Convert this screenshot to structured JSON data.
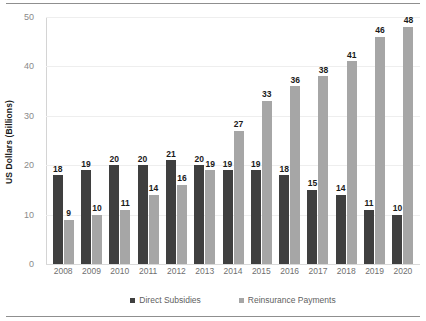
{
  "chart_data": {
    "type": "bar",
    "title": "",
    "subtitle": "",
    "xlabel": "",
    "ylabel": "US Dollars (Billions)",
    "categories": [
      "2008",
      "2009",
      "2010",
      "2011",
      "2012",
      "2013",
      "2014",
      "2015",
      "2016",
      "2017",
      "2018",
      "2019",
      "2020"
    ],
    "series": [
      {
        "name": "Direct Subsidies",
        "color": "#3f3f3f",
        "values": [
          18,
          19,
          20,
          20,
          21,
          20,
          19,
          19,
          18,
          15,
          14,
          11,
          10
        ]
      },
      {
        "name": "Reinsurance Payments",
        "color": "#a6a6a6",
        "values": [
          9,
          10,
          11,
          14,
          16,
          19,
          27,
          33,
          36,
          38,
          41,
          46,
          48
        ]
      }
    ],
    "ylim": [
      0,
      50
    ],
    "yticks": [
      0,
      10,
      20,
      30,
      40,
      50
    ],
    "ytick_labels": [
      "0",
      "10",
      "20",
      "30",
      "40",
      "50"
    ],
    "grid": true,
    "grid_axis": "y",
    "legend_position": "bottom",
    "data_labels": true,
    "bar_group_layout": "clustered"
  },
  "axes": {
    "y_title": "US Dollars (Billions)"
  },
  "legend": {
    "items": [
      {
        "label": "Direct Subsidies",
        "color": "#3f3f3f"
      },
      {
        "label": "Reinsurance Payments",
        "color": "#a6a6a6"
      }
    ]
  },
  "colors": {
    "series_dark": "#3f3f3f",
    "series_light": "#a6a6a6",
    "gridline": "#eeeeee",
    "axis": "#d4d4d4",
    "rule": "#8f8f8f",
    "tick_text": "#8a8a8a",
    "xtick_text": "#6f6f6f",
    "legend_text": "#5f5f5f",
    "label_text": "#1a1a1a",
    "background": "#ffffff"
  }
}
